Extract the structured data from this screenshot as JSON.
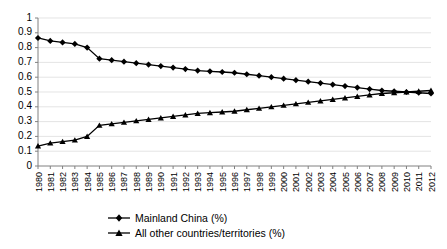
{
  "chart_data": {
    "type": "line",
    "title": "",
    "subtitle": "",
    "xlabel": "",
    "ylabel": "",
    "ylim": [
      0,
      1
    ],
    "ytick_labels": [
      "0",
      "0.1",
      "0.2",
      "0.3",
      "0.4",
      "0.5",
      "0.6",
      "0.7",
      "0.8",
      "0.9",
      "1"
    ],
    "ytick_values": [
      0,
      0.1,
      0.2,
      0.3,
      0.4,
      0.5,
      0.6,
      0.7,
      0.8,
      0.9,
      1
    ],
    "grid": true,
    "legend_position": "bottom",
    "categories": [
      "1980",
      "1981",
      "1982",
      "1983",
      "1984",
      "1985",
      "1986",
      "1987",
      "1988",
      "1989",
      "1990",
      "1991",
      "1992",
      "1993",
      "1994",
      "1995",
      "1996",
      "1997",
      "1998",
      "1999",
      "2000",
      "2001",
      "2002",
      "2003",
      "2004",
      "2005",
      "2006",
      "2007",
      "2008",
      "2009",
      "2010",
      "2011",
      "2012"
    ],
    "series": [
      {
        "name": "Mainland China (%)",
        "marker": "diamond",
        "values": [
          0.865,
          0.845,
          0.835,
          0.825,
          0.8,
          0.725,
          0.715,
          0.705,
          0.695,
          0.685,
          0.675,
          0.665,
          0.655,
          0.645,
          0.64,
          0.635,
          0.63,
          0.62,
          0.61,
          0.6,
          0.59,
          0.58,
          0.57,
          0.56,
          0.55,
          0.54,
          0.53,
          0.52,
          0.51,
          0.505,
          0.5,
          0.495,
          0.49
        ]
      },
      {
        "name": "All other countries/territories (%)",
        "marker": "triangle",
        "values": [
          0.135,
          0.155,
          0.165,
          0.175,
          0.2,
          0.275,
          0.285,
          0.295,
          0.305,
          0.315,
          0.325,
          0.335,
          0.345,
          0.355,
          0.36,
          0.365,
          0.37,
          0.38,
          0.39,
          0.4,
          0.41,
          0.42,
          0.43,
          0.44,
          0.45,
          0.46,
          0.47,
          0.48,
          0.49,
          0.495,
          0.5,
          0.505,
          0.51
        ]
      }
    ]
  }
}
